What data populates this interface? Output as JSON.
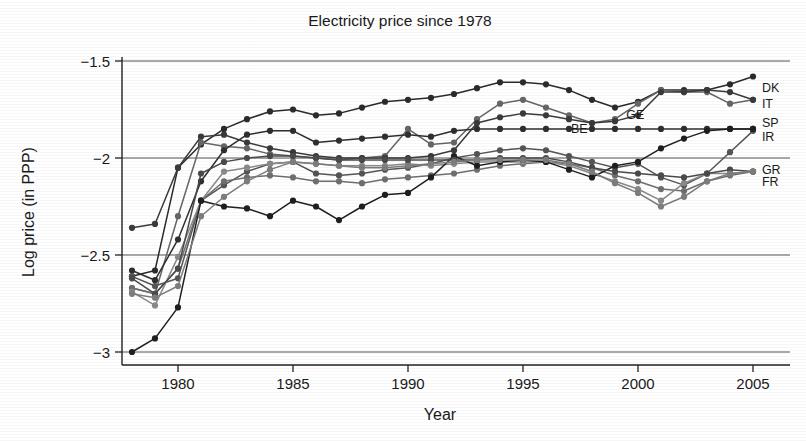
{
  "chart_data": {
    "type": "line",
    "title": "Electricity price since 1978",
    "xlabel": "Year",
    "ylabel": "Log price (in PPP)",
    "xlim": [
      1977.6,
      2005.4
    ],
    "ylim": [
      -3.08,
      -1.44
    ],
    "xticks": [
      1980,
      1985,
      1990,
      1995,
      2000,
      2005
    ],
    "xticklabels": [
      "1980",
      "1985",
      "1990",
      "1995",
      "2000",
      "2005"
    ],
    "yticks": [
      -1.5,
      -2,
      -2.5,
      -3
    ],
    "yticklabels": [
      "-1.5",
      "-2",
      "-2.5",
      "-3"
    ],
    "grid": true,
    "gridlines_y": [
      -1.5,
      -2,
      -2.5,
      -3
    ],
    "legend_position": "right-inline-labels",
    "x": [
      1978,
      1979,
      1980,
      1981,
      1982,
      1983,
      1984,
      1985,
      1986,
      1987,
      1988,
      1989,
      1990,
      1991,
      1992,
      1993,
      1994,
      1995,
      1996,
      1997,
      1998,
      1999,
      2000,
      2001,
      2002,
      2003,
      2004,
      2005
    ],
    "series": [
      {
        "name": "DK",
        "label": "DK",
        "color": "#2b2b2b",
        "label_x": 2005.3,
        "label_y": -1.635,
        "values": [
          -2.61,
          -2.58,
          -2.05,
          -1.93,
          -1.85,
          -1.8,
          -1.76,
          -1.75,
          -1.78,
          -1.77,
          -1.74,
          -1.71,
          -1.7,
          -1.69,
          -1.67,
          -1.64,
          -1.61,
          -1.61,
          -1.62,
          -1.65,
          -1.7,
          -1.74,
          -1.71,
          -1.65,
          -1.65,
          -1.65,
          -1.62,
          -1.58
        ]
      },
      {
        "name": "IT",
        "label": "IT",
        "color": "#666666",
        "label_x": 2005.3,
        "label_y": -1.715,
        "values": [
          -2.67,
          -2.7,
          -2.3,
          -1.92,
          -1.94,
          -1.95,
          -1.98,
          -1.99,
          -2.0,
          -2.01,
          -2.0,
          -1.99,
          -1.85,
          -1.93,
          -1.92,
          -1.8,
          -1.72,
          -1.7,
          -1.74,
          -1.78,
          -1.82,
          -1.8,
          -1.72,
          -1.65,
          -1.66,
          -1.66,
          -1.72,
          -1.7
        ]
      },
      {
        "name": "GE",
        "label": "GE",
        "color": "#3a3a3a",
        "label_x": 1999.4,
        "label_y": -1.775,
        "values": [
          -2.36,
          -2.34,
          -2.05,
          -1.89,
          -1.88,
          -1.92,
          -1.95,
          -1.97,
          -1.99,
          -2.0,
          -2.0,
          -2.0,
          -2.0,
          -1.99,
          -1.96,
          -1.82,
          -1.79,
          -1.77,
          -1.78,
          -1.8,
          -1.82,
          -1.81,
          -1.78,
          -1.66,
          -1.66,
          -1.65,
          -1.66,
          -1.7
        ]
      },
      {
        "name": "SP",
        "label": "SP",
        "color": "#2f2f2f",
        "label_x": 2005.3,
        "label_y": -1.815,
        "values": [
          -2.58,
          -2.63,
          -2.42,
          -2.12,
          -1.96,
          -1.88,
          -1.86,
          -1.86,
          -1.92,
          -1.91,
          -1.9,
          -1.89,
          -1.88,
          -1.89,
          -1.86,
          -1.85,
          -1.85,
          -1.85,
          -1.85,
          -1.85,
          -1.85,
          -1.85,
          -1.85,
          -1.85,
          -1.85,
          -1.85,
          -1.85,
          -1.85
        ]
      },
      {
        "name": "IR",
        "label": "IR",
        "color": "#555555",
        "label_x": 2005.3,
        "label_y": -1.885,
        "values": [
          -2.61,
          -2.66,
          -2.62,
          -2.22,
          -2.14,
          -2.07,
          -2.03,
          -2.02,
          -2.08,
          -2.09,
          -2.08,
          -2.06,
          -2.05,
          -2.03,
          -2.0,
          -1.98,
          -1.96,
          -1.95,
          -1.96,
          -1.99,
          -2.02,
          -2.05,
          -2.03,
          -2.1,
          -2.14,
          -2.08,
          -1.97,
          -1.86
        ]
      },
      {
        "name": "GR",
        "label": "GR",
        "color": "#6f6f6f",
        "label_x": 2005.3,
        "label_y": -2.055,
        "values": [
          -2.67,
          -2.7,
          -2.57,
          -2.22,
          -2.12,
          -2.1,
          -2.09,
          -2.1,
          -2.12,
          -2.12,
          -2.13,
          -2.11,
          -2.1,
          -2.09,
          -2.08,
          -2.06,
          -2.04,
          -2.03,
          -2.02,
          -2.03,
          -2.05,
          -2.09,
          -2.12,
          -2.16,
          -2.17,
          -2.12,
          -2.09,
          -2.07
        ]
      },
      {
        "name": "FR",
        "label": "FR",
        "color": "#8a8a8a",
        "label_x": 2005.3,
        "label_y": -2.12,
        "values": [
          -2.69,
          -2.76,
          -2.51,
          -2.22,
          -2.07,
          -2.05,
          -2.03,
          -2.02,
          -2.03,
          -2.04,
          -2.04,
          -2.04,
          -2.03,
          -2.04,
          -2.03,
          -2.02,
          -2.02,
          -2.02,
          -2.02,
          -2.04,
          -2.08,
          -2.12,
          -2.16,
          -2.22,
          -2.13,
          -2.08,
          -2.08,
          -2.07
        ]
      },
      {
        "name": "BE",
        "label": "BE",
        "color": "#1f1f1f",
        "label_x": 1997.0,
        "label_y": -1.845,
        "values": [
          -3.0,
          -2.93,
          -2.77,
          -2.22,
          -2.25,
          -2.26,
          -2.3,
          -2.22,
          -2.25,
          -2.32,
          -2.25,
          -2.19,
          -2.18,
          -2.1,
          -1.99,
          -2.04,
          -2.02,
          -2.01,
          -2.02,
          -2.06,
          -2.1,
          -2.04,
          -2.02,
          -1.95,
          -1.9,
          -1.86,
          -1.85,
          -1.85
        ]
      },
      {
        "name": "series-9",
        "label": "",
        "color": "#4a4a4a",
        "label_x": null,
        "label_y": null,
        "values": [
          -2.62,
          -2.7,
          -2.57,
          -2.08,
          -2.02,
          -2.0,
          -1.99,
          -1.99,
          -2.0,
          -2.01,
          -2.01,
          -2.01,
          -2.01,
          -2.01,
          -2.01,
          -2.01,
          -2.0,
          -2.0,
          -2.0,
          -2.02,
          -2.05,
          -2.07,
          -2.08,
          -2.09,
          -2.1,
          -2.08,
          -2.06,
          -2.07
        ]
      },
      {
        "name": "series-10",
        "label": "",
        "color": "#7d7d7d",
        "label_x": null,
        "label_y": null,
        "values": [
          -2.7,
          -2.72,
          -2.66,
          -2.3,
          -2.2,
          -2.12,
          -2.06,
          -2.02,
          -2.03,
          -2.04,
          -2.05,
          -2.05,
          -2.04,
          -2.03,
          -2.02,
          -2.01,
          -2.01,
          -2.01,
          -2.01,
          -2.03,
          -2.07,
          -2.13,
          -2.18,
          -2.25,
          -2.2,
          -2.12,
          -2.08,
          -2.07
        ]
      }
    ]
  },
  "marker": {
    "radius": 3.1,
    "shape": "circle"
  }
}
